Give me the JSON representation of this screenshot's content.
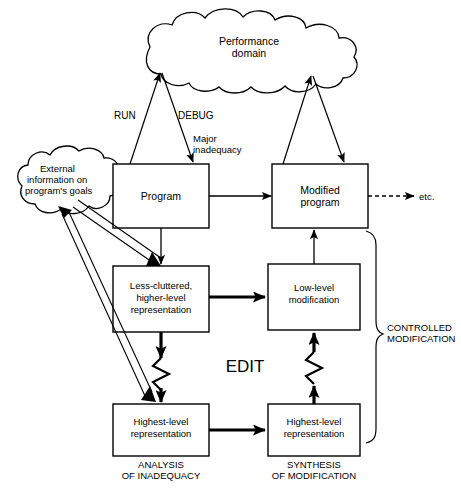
{
  "diagram": {
    "stroke_color": "#000000",
    "background_color": "#ffffff",
    "nodes": {
      "performance_domain": {
        "label_line1": "Performance",
        "label_line2": "domain",
        "shape": "cloud"
      },
      "external_info": {
        "label_line1": "External",
        "label_line2": "information on",
        "label_line3": "program's goals",
        "shape": "cloud"
      },
      "program": {
        "label": "Program",
        "shape": "box"
      },
      "modified_program": {
        "label_line1": "Modified",
        "label_line2": "program",
        "shape": "box"
      },
      "less_cluttered": {
        "label_line1": "Less-cluttered,",
        "label_line2": "higher-level",
        "label_line3": "representation",
        "shape": "box"
      },
      "low_level_mod": {
        "label_line1": "Low-level",
        "label_line2": "modification",
        "shape": "box"
      },
      "highest_level_left": {
        "label_line1": "Highest-level",
        "label_line2": "representation",
        "shape": "box"
      },
      "highest_level_right": {
        "label_line1": "Highest-level",
        "label_line2": "representation",
        "shape": "box"
      }
    },
    "edge_labels": {
      "run": "RUN",
      "debug": "DEBUG",
      "major_inadequacy_line1": "Major",
      "major_inadequacy_line2": "inadequacy",
      "etc": "etc."
    },
    "annotations": {
      "edit": "EDIT",
      "analysis_line1": "ANALYSIS",
      "analysis_line2": "OF INADEQUACY",
      "synthesis_line1": "SYNTHESIS",
      "synthesis_line2": "OF MODIFICATION",
      "controlled_line1": "CONTROLLED",
      "controlled_line2": "MODIFICATION"
    }
  }
}
